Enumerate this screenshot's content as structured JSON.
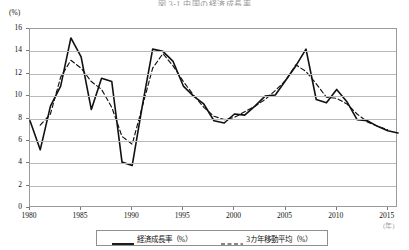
{
  "figure": {
    "title": "図 3-1  中国の経済成長率",
    "y_axis_unit": "(%)",
    "x_axis_unit": "(年)"
  },
  "legend": {
    "items": [
      {
        "label": "経済成長率（%）",
        "style": "solid",
        "color": "#111111",
        "icon": "solid-line-swatch"
      },
      {
        "label": "3カ年移動平均（%）",
        "style": "dashed",
        "color": "#111111",
        "icon": "dashed-line-swatch"
      }
    ]
  },
  "chart_data": {
    "type": "line",
    "title": "図 3-1  中国の経済成長率",
    "xlabel": "(年)",
    "ylabel": "(%)",
    "xlim": [
      1980,
      2016
    ],
    "ylim": [
      0,
      16
    ],
    "ytick_labels": [
      "0",
      "2",
      "4",
      "6",
      "8",
      "10",
      "12",
      "14",
      "16"
    ],
    "yticks": [
      0,
      2,
      4,
      6,
      8,
      10,
      12,
      14,
      16
    ],
    "xtick_labels": [
      "1980",
      "1985",
      "1990",
      "1995",
      "2000",
      "2005",
      "2010",
      "2015"
    ],
    "xticks": [
      1980,
      1985,
      1990,
      1995,
      2000,
      2005,
      2010,
      2015
    ],
    "grid": "horizontal",
    "legend_position": "below-axes",
    "x": [
      1980,
      1981,
      1982,
      1983,
      1984,
      1985,
      1986,
      1987,
      1988,
      1989,
      1990,
      1991,
      1992,
      1993,
      1994,
      1995,
      1996,
      1997,
      1998,
      1999,
      2000,
      2001,
      2002,
      2003,
      2004,
      2005,
      2006,
      2007,
      2008,
      2009,
      2010,
      2011,
      2012,
      2013,
      2014,
      2015,
      2016
    ],
    "series": [
      {
        "name": "経済成長率（%）",
        "style": "solid",
        "color": "#111111",
        "values": [
          7.8,
          5.2,
          9.1,
          10.9,
          15.2,
          13.5,
          8.8,
          11.6,
          11.3,
          4.1,
          3.8,
          9.2,
          14.2,
          14.0,
          13.1,
          10.9,
          10.0,
          9.3,
          7.8,
          7.6,
          8.4,
          8.3,
          9.1,
          10.0,
          10.1,
          11.4,
          12.7,
          14.2,
          9.7,
          9.4,
          10.6,
          9.5,
          7.9,
          7.8,
          7.3,
          6.9,
          6.7
        ]
      },
      {
        "name": "3カ年移動平均（%）",
        "style": "dashed",
        "color": "#111111",
        "values": [
          null,
          7.4,
          8.4,
          11.7,
          13.2,
          12.5,
          11.3,
          10.6,
          9.0,
          6.4,
          5.7,
          9.1,
          12.5,
          13.8,
          12.7,
          11.3,
          10.1,
          9.0,
          8.2,
          7.9,
          8.1,
          8.6,
          9.1,
          9.7,
          10.5,
          11.4,
          12.8,
          12.2,
          11.1,
          9.9,
          9.8,
          9.3,
          8.4,
          7.7,
          7.3,
          7.0,
          null
        ]
      }
    ]
  }
}
